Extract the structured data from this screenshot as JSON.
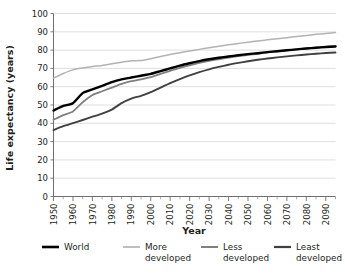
{
  "chart_data": {
    "type": "line",
    "title": "",
    "xlabel": "Year",
    "ylabel": "Life expectancy (years)",
    "xlim": [
      1950,
      2095
    ],
    "ylim": [
      0,
      100
    ],
    "grid": true,
    "legend_position": "bottom",
    "y_ticks": [
      0,
      10,
      20,
      30,
      40,
      50,
      60,
      70,
      80,
      90,
      100
    ],
    "y_tick_labels": [
      "0",
      "10",
      "20",
      "30",
      "40",
      "50",
      "60",
      "70",
      "80",
      "90",
      "100"
    ],
    "x_ticks": [
      1950,
      1960,
      1970,
      1980,
      1990,
      2000,
      2010,
      2020,
      2030,
      2040,
      2050,
      2060,
      2070,
      2080,
      2090
    ],
    "x_tick_labels": [
      "1950",
      "1960",
      "1970",
      "1980",
      "1990",
      "2000",
      "2010",
      "2020",
      "2030",
      "2040",
      "2050",
      "2060",
      "2070",
      "2080",
      "2090"
    ],
    "x_minor_tick_step": 5,
    "x": [
      1950,
      1955,
      1960,
      1965,
      1970,
      1975,
      1980,
      1985,
      1990,
      1995,
      2000,
      2005,
      2010,
      2015,
      2020,
      2025,
      2030,
      2035,
      2040,
      2045,
      2050,
      2055,
      2060,
      2065,
      2070,
      2075,
      2080,
      2085,
      2090,
      2095
    ],
    "series": [
      {
        "name": "World",
        "color": "#000000",
        "width": 2.4,
        "values": [
          47.0,
          49.5,
          51.0,
          56.5,
          58.5,
          60.5,
          62.5,
          64.0,
          65.0,
          66.0,
          67.0,
          68.5,
          70.0,
          71.5,
          72.8,
          74.0,
          75.0,
          75.8,
          76.5,
          77.2,
          77.8,
          78.3,
          78.9,
          79.4,
          79.9,
          80.4,
          80.9,
          81.3,
          81.7,
          82.0
        ]
      },
      {
        "name": "More developed",
        "color": "#b3b3b3",
        "width": 1.5,
        "values": [
          64.7,
          67.2,
          69.2,
          70.2,
          71.0,
          71.6,
          72.5,
          73.4,
          74.2,
          74.3,
          75.3,
          76.5,
          77.6,
          78.6,
          79.5,
          80.4,
          81.3,
          82.1,
          82.9,
          83.6,
          84.3,
          85.0,
          85.6,
          86.2,
          86.8,
          87.4,
          88.0,
          88.6,
          89.1,
          89.6
        ]
      },
      {
        "name": "Less developed",
        "color": "#808080",
        "width": 1.8,
        "values": [
          42.0,
          44.5,
          46.5,
          51.5,
          55.5,
          57.5,
          59.5,
          61.5,
          63.0,
          64.0,
          65.2,
          67.0,
          68.6,
          70.3,
          71.7,
          73.0,
          74.1,
          75.0,
          75.9,
          76.7,
          77.4,
          78.0,
          78.7,
          79.3,
          79.9,
          80.4,
          80.9,
          81.4,
          81.8,
          82.2
        ]
      },
      {
        "name": "Least developed",
        "color": "#404040",
        "width": 1.9,
        "values": [
          36.3,
          38.4,
          40.1,
          41.8,
          43.6,
          45.3,
          47.5,
          51.0,
          53.5,
          55.0,
          57.0,
          59.5,
          62.0,
          64.2,
          66.2,
          68.0,
          69.5,
          70.8,
          72.0,
          73.0,
          73.9,
          74.7,
          75.4,
          76.0,
          76.6,
          77.1,
          77.6,
          78.0,
          78.4,
          78.7
        ]
      }
    ],
    "legend": [
      {
        "label_line1": "World",
        "label_line2": "",
        "color": "#000000",
        "width": 2.6
      },
      {
        "label_line1": "More",
        "label_line2": "developed",
        "color": "#b3b3b3",
        "width": 1.7
      },
      {
        "label_line1": "Less",
        "label_line2": "developed",
        "color": "#808080",
        "width": 2.0
      },
      {
        "label_line1": "Least",
        "label_line2": "developed",
        "color": "#404040",
        "width": 2.2
      }
    ]
  },
  "axes": {
    "y_title": "Life expectancy (years)",
    "x_title": "Year"
  },
  "colors": {
    "background": "#ffffff",
    "grid": "#d7d7d7",
    "axis": "#6f6f6f",
    "text": "#231f20"
  }
}
